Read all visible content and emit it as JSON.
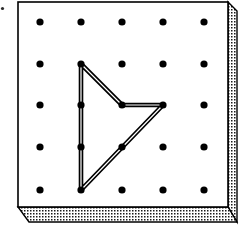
{
  "figure": {
    "name": "geoboard",
    "canvas": {
      "width": 239,
      "height": 226
    }
  },
  "board": {
    "face_color": "#ffffff",
    "outline_color": "#000000",
    "outline_width": 1.6,
    "face": {
      "x": 18,
      "y": 2,
      "width": 210,
      "height": 205
    },
    "depth": 15,
    "side_shading": {
      "pattern": "stipple-dots",
      "dot_color": "#1a1a1a",
      "background": "#ffffff",
      "cell": 3,
      "dot_size": 1.5
    }
  },
  "grid": {
    "rows": 5,
    "columns": 5,
    "dot_color": "#000000",
    "dot_radius": 3.6,
    "x_positions": [
      40,
      81,
      122,
      163,
      204
    ],
    "y_positions": [
      22,
      64,
      105,
      147,
      190
    ],
    "spacing_x": 41,
    "spacing_y": 42
  },
  "rubber_band": {
    "color": "#000000",
    "stroke_width": 4.2,
    "inner_color": "#ffffff",
    "inner_stroke_width": 1.2,
    "closed": true,
    "vertices": [
      {
        "label": "top",
        "row": 2,
        "col": 2,
        "x": 81,
        "y": 64
      },
      {
        "label": "notch",
        "row": 3,
        "col": 3,
        "x": 122,
        "y": 105
      },
      {
        "label": "right",
        "row": 3,
        "col": 4,
        "x": 163,
        "y": 105
      },
      {
        "label": "bottom",
        "row": 5,
        "col": 2,
        "x": 81,
        "y": 190
      }
    ],
    "pegs_used": [
      "B2",
      "C3",
      "D3",
      "B5"
    ]
  },
  "artifacts": {
    "speck": {
      "x": 2.5,
      "y": 8.5,
      "radius": 1.6,
      "color": "#2b2b2b"
    }
  }
}
